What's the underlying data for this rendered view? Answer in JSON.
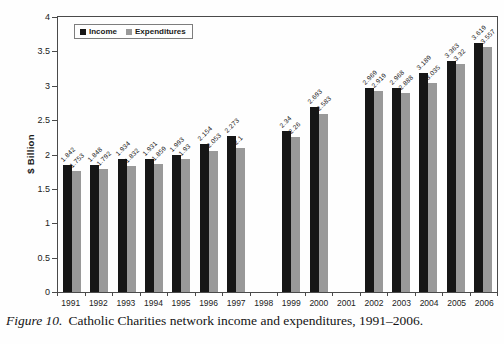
{
  "chart_data": {
    "type": "bar",
    "title": "",
    "xlabel": "",
    "ylabel": "$ Billion",
    "ylim": [
      0,
      4
    ],
    "ytick_labels": [
      "4",
      "3.5",
      "3",
      "2.5",
      "2",
      "1.5",
      "1",
      "0.5",
      "0"
    ],
    "grid": false,
    "legend_position": "top-left-inside",
    "categories": [
      "1991",
      "1992",
      "1993",
      "1994",
      "1995",
      "1996",
      "1997",
      "1998",
      "1999",
      "2000",
      "2001",
      "2002",
      "2003",
      "2004",
      "2005",
      "2006"
    ],
    "series": [
      {
        "name": "Income",
        "color": "#161616",
        "values": [
          1.842,
          1.848,
          1.934,
          1.931,
          1.993,
          2.154,
          2.273,
          null,
          2.34,
          2.693,
          null,
          2.969,
          2.968,
          3.189,
          3.363,
          3.619
        ]
      },
      {
        "name": "Expenditures",
        "color": "#999999",
        "values": [
          1.753,
          1.792,
          1.832,
          1.859,
          1.93,
          2.053,
          2.1,
          null,
          2.26,
          2.583,
          null,
          2.919,
          2.888,
          3.035,
          3.32,
          3.557
        ]
      }
    ]
  },
  "legend": {
    "items": [
      {
        "label": "Income",
        "color": "#161616"
      },
      {
        "label": "Expenditures",
        "color": "#999999"
      }
    ]
  },
  "caption": {
    "label": "Figure 10.",
    "text": "Catholic Charities network income and expenditures, 1991–2006."
  }
}
